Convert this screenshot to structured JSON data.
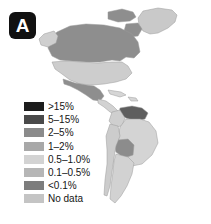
{
  "panel": {
    "letter": "A"
  },
  "map": {
    "name": "americas-choropleth",
    "ocean_color": "#ffffff",
    "border_color": "#9a9a9a",
    "regions": [
      {
        "name": "greenland",
        "label": "Greenland",
        "bin": "0.5-1.0%",
        "color": "#c9c9c9"
      },
      {
        "name": "canada",
        "label": "Canada",
        "bin": "2-5%",
        "color": "#8e8e8e"
      },
      {
        "name": "alaska",
        "label": "Alaska",
        "bin": "0.5-1.0%",
        "color": "#cfcfcf"
      },
      {
        "name": "united-states",
        "label": "United States",
        "bin": "0.5-1.0%",
        "color": "#cdcdcd"
      },
      {
        "name": "mexico",
        "label": "Mexico",
        "bin": "2-5%",
        "color": "#8e8e8e"
      },
      {
        "name": "central-america",
        "label": "Central America",
        "bin": "0.5-1.0%",
        "color": "#d2d2d2"
      },
      {
        "name": "caribbean",
        "label": "Caribbean",
        "bin": "0.5-1.0%",
        "color": "#d6d6d6"
      },
      {
        "name": "venezuela-guyana",
        "label": "Venezuela / Guyanas",
        "bin": "5-15%",
        "color": "#5e5e5e"
      },
      {
        "name": "colombia",
        "label": "Colombia",
        "bin": "0.5-1.0%",
        "color": "#cfcfcf"
      },
      {
        "name": "brazil",
        "label": "Brazil",
        "bin": "0.5-1.0%",
        "color": "#d4d4d4"
      },
      {
        "name": "bolivia-paraguay",
        "label": "Bolivia / Paraguay",
        "bin": "2-5%",
        "color": "#8c8c8c"
      },
      {
        "name": "peru-chile",
        "label": "Peru / Chile",
        "bin": "0.5-1.0%",
        "color": "#cccccc"
      },
      {
        "name": "argentina",
        "label": "Argentina",
        "bin": "0.5-1.0%",
        "color": "#d2d2d2"
      }
    ]
  },
  "legend": {
    "name": "prevalence-legend",
    "entries": [
      {
        "label": ">15%",
        "color": "#1c1c1c"
      },
      {
        "label": "5–15%",
        "color": "#4a4a4a"
      },
      {
        "label": "2–5%",
        "color": "#8b8b8b"
      },
      {
        "label": "1–2%",
        "color": "#a8a8a8"
      },
      {
        "label": "0.5–1.0%",
        "color": "#d3d3d3"
      },
      {
        "label": "0.1–0.5%",
        "color": "#b6b6b6"
      },
      {
        "label": "<0.1%",
        "color": "#7d7d7d"
      },
      {
        "label": "No data",
        "color": "#c4c4c4"
      }
    ]
  }
}
